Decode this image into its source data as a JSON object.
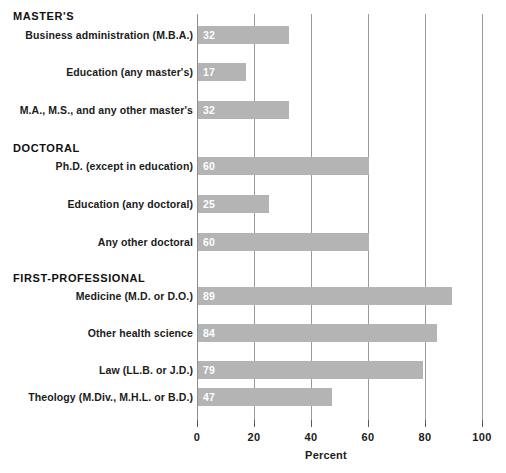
{
  "chart_data": {
    "type": "bar",
    "orientation": "horizontal",
    "title": "",
    "xlabel": "Percent",
    "ylabel": "",
    "xlim": [
      0,
      100
    ],
    "xticks": [
      0,
      20,
      40,
      60,
      80,
      100
    ],
    "xtick_labels": [
      "0",
      "20",
      "40",
      "60",
      "80",
      "100"
    ],
    "grid": true,
    "grid_axis": "x",
    "legend": null,
    "bar_color": "#b4b4b4",
    "value_label_color": "#ffffff",
    "groups": [
      {
        "heading": "MASTER'S",
        "categories": [
          "Business administration (M.B.A.)",
          "Education (any master's)",
          "M.A., M.S., and any other master's"
        ],
        "values": [
          32,
          17,
          32
        ]
      },
      {
        "heading": "DOCTORAL",
        "categories": [
          "Ph.D. (except in education)",
          "Education (any doctoral)",
          "Any other doctoral"
        ],
        "values": [
          60,
          25,
          60
        ]
      },
      {
        "heading": "FIRST-PROFESSIONAL",
        "categories": [
          "Medicine (M.D. or D.O.)",
          "Other health science",
          "Law (LL.B. or J.D.)",
          "Theology (M.Div., M.H.L. or B.D.)"
        ],
        "values": [
          89,
          84,
          79,
          47
        ]
      }
    ]
  }
}
